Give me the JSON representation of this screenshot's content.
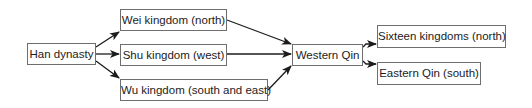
{
  "diagram": {
    "type": "flowchart",
    "colors": {
      "box_border": "#6e6e6e",
      "arrow": "#1c1c1c",
      "text": "#1c1c1c",
      "background": "#ffffff"
    },
    "nodes": [
      {
        "id": "han",
        "label": "Han dynasty"
      },
      {
        "id": "wei",
        "label": "Wei kingdom (north)"
      },
      {
        "id": "shu",
        "label": "Shu kingdom (west)"
      },
      {
        "id": "wu",
        "label": "Wu kingdom (south and east)"
      },
      {
        "id": "western_qin",
        "label": "Western Qin"
      },
      {
        "id": "sixteen",
        "label": "Sixteen kingdoms (north)"
      },
      {
        "id": "eastern_qin",
        "label": "Eastern Qin (south)"
      }
    ],
    "edges": [
      {
        "from": "han",
        "to": "wei"
      },
      {
        "from": "han",
        "to": "shu"
      },
      {
        "from": "han",
        "to": "wu"
      },
      {
        "from": "wei",
        "to": "western_qin"
      },
      {
        "from": "shu",
        "to": "western_qin"
      },
      {
        "from": "wu",
        "to": "western_qin"
      },
      {
        "from": "western_qin",
        "to": "sixteen"
      },
      {
        "from": "western_qin",
        "to": "eastern_qin"
      }
    ]
  }
}
